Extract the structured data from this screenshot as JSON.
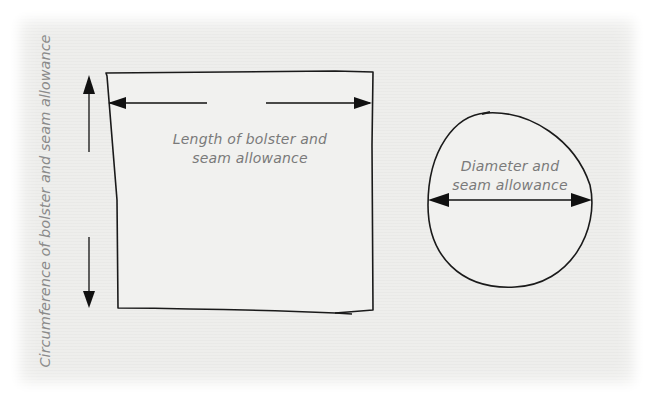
{
  "diagram": {
    "rectangle": {
      "length_label_line1": "Length of bolster and",
      "length_label_line2": "seam allowance"
    },
    "side_label": "Circumference of bolster and seam allowance",
    "circle": {
      "label_line1": "Diameter and",
      "label_line2": "seam allowance"
    },
    "colors": {
      "line": "#111111",
      "text": "#7a7a7a",
      "background": "#eeeeec"
    }
  }
}
